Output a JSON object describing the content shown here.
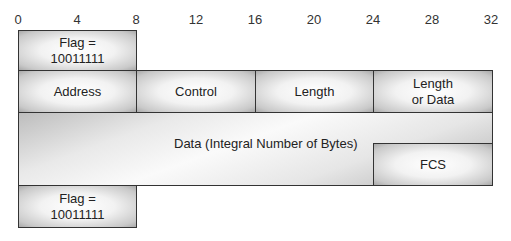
{
  "bit_ruler": {
    "ticks": [
      "0",
      "4",
      "8",
      "12",
      "16",
      "20",
      "24",
      "28",
      "32"
    ]
  },
  "frame": {
    "top_flag": {
      "line1": "Flag =",
      "line2": "10011111"
    },
    "fields": [
      {
        "label": "Address"
      },
      {
        "label": "Control"
      },
      {
        "label": "Length"
      },
      {
        "label_line1": "Length",
        "label_line2": "or Data"
      }
    ],
    "data": {
      "label": "Data (Integral Number of Bytes)"
    },
    "fcs": {
      "label": "FCS"
    },
    "bottom_flag": {
      "line1": "Flag =",
      "line2": "10011111"
    }
  }
}
